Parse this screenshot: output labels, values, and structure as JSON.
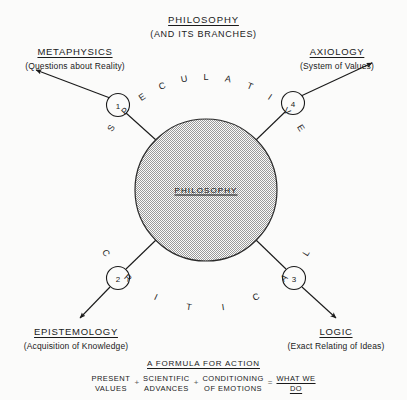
{
  "diagram": {
    "title": {
      "head": "PHILOSOPHY",
      "sub": "(AND ITS BRANCHES)"
    },
    "center": {
      "label": "PHILOSOPHY",
      "fill": "#d8d8d8",
      "stroke": "#222222"
    },
    "arc_words": {
      "top": "SPECULATIVE",
      "bottom": "CRITICAL"
    },
    "branches": [
      {
        "number": "1",
        "head": "METAPHYSICS",
        "sub": "(Questions about Reality)",
        "position": "top-left"
      },
      {
        "number": "4",
        "head": "AXIOLOGY",
        "sub": "(System of Values)",
        "position": "top-right"
      },
      {
        "number": "2",
        "head": "EPISTEMOLOGY",
        "sub": "(Acquisition of Knowledge)",
        "position": "bottom-left"
      },
      {
        "number": "3",
        "head": "LOGIC",
        "sub": "(Exact Relating of Ideas)",
        "position": "bottom-right"
      }
    ],
    "formula": {
      "title": "A FORMULA FOR ACTION",
      "terms": [
        {
          "l1": "PRESENT",
          "l2": "VALUES"
        },
        {
          "l1": "SCIENTIFIC",
          "l2": "ADVANCES"
        },
        {
          "l1": "CONDITIONING",
          "l2": "OF EMOTIONS"
        }
      ],
      "operators": [
        "+",
        "+",
        "="
      ],
      "result": {
        "l1": "WHAT WE",
        "l2": "DO"
      }
    },
    "colors": {
      "background": "#fbfbfa",
      "ink": "#1a1a1a",
      "circle_fill": "#d8d8d8"
    }
  }
}
